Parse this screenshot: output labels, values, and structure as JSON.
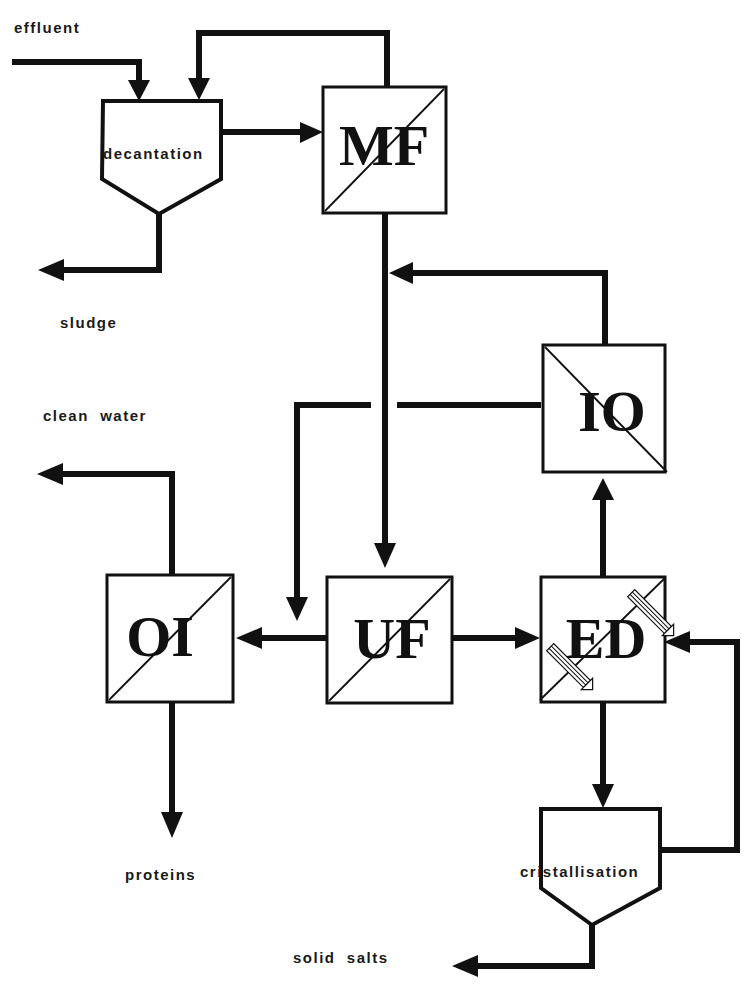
{
  "diagram": {
    "type": "process-flow",
    "colors": {
      "line": "#111111",
      "background": "#ffffff"
    },
    "labels": {
      "effluent": "effluent",
      "sludge": "sludge",
      "clean_water": "clean  water",
      "proteins": "proteins",
      "solid_salts": "solid  salts"
    },
    "units": {
      "decantation": {
        "label": "decantation",
        "kind": "settling-tank"
      },
      "mf": {
        "label": "MF",
        "kind": "membrane-module"
      },
      "oi_top": {
        "label": "OI",
        "kind": "membrane-module",
        "note": "rendered mirrored/rotated"
      },
      "oi_left": {
        "label": "OI",
        "kind": "membrane-module"
      },
      "uf": {
        "label": "UF",
        "kind": "membrane-module"
      },
      "ed": {
        "label": "ED",
        "kind": "electrodialysis-module"
      },
      "cristallisation": {
        "label": "cristallisation",
        "kind": "settling-tank"
      }
    },
    "flows": [
      {
        "from": "effluent",
        "to": "decantation"
      },
      {
        "from": "mf",
        "to": "decantation",
        "note": "recycle (retentate)"
      },
      {
        "from": "decantation",
        "to": "mf"
      },
      {
        "from": "decantation",
        "to": "sludge"
      },
      {
        "from": "mf",
        "to": "uf"
      },
      {
        "from": "oi_top",
        "to": "mf-uf line"
      },
      {
        "from": "oi_top",
        "to": "oi_left feed line (crossing)"
      },
      {
        "from": "uf",
        "to": "oi_left"
      },
      {
        "from": "uf",
        "to": "ed"
      },
      {
        "from": "ed",
        "to": "oi_top"
      },
      {
        "from": "ed",
        "to": "cristallisation"
      },
      {
        "from": "cristallisation",
        "to": "ed",
        "note": "recycle"
      },
      {
        "from": "oi_left",
        "to": "clean water"
      },
      {
        "from": "oi_left",
        "to": "proteins"
      },
      {
        "from": "cristallisation",
        "to": "solid salts"
      }
    ]
  }
}
